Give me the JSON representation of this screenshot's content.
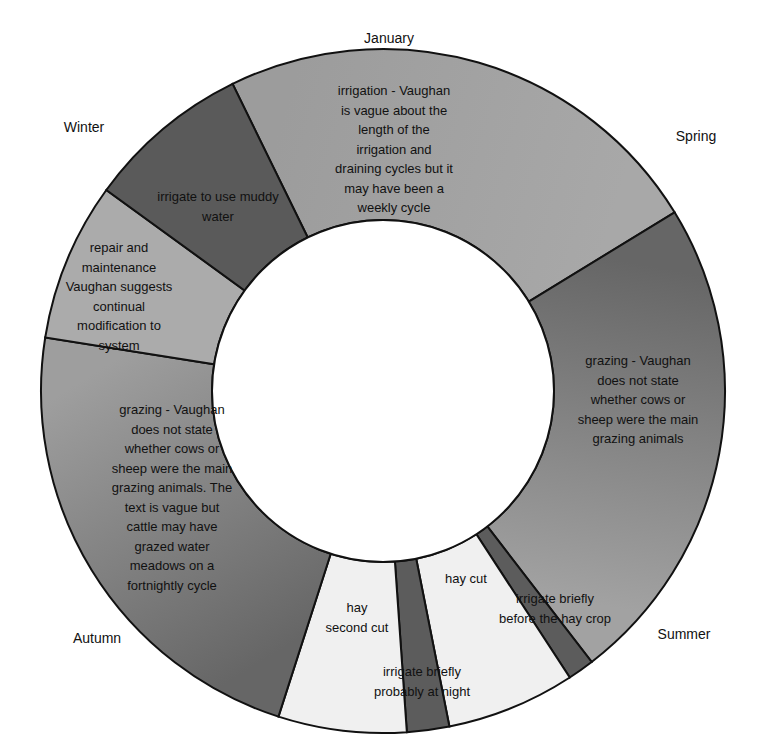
{
  "chart_data": {
    "type": "pie",
    "subtype": "donut",
    "title": "",
    "start_angle_deg": 333.9,
    "center": [
      383,
      391
    ],
    "outer_radius": 342,
    "inner_radius": 171,
    "segments": [
      {
        "label": "irrigation - Vaughan is vague about the length of the irrigation and draining cycles but it may have been a weekly cycle",
        "lines": [
          "irrigation - Vaughan",
          "is vague about the",
          "length of the",
          "irrigation and",
          "draining cycles but it",
          "may have been a",
          "weekly cycle"
        ],
        "value": 84.6,
        "color": "#9c9c9c",
        "color_end": "#a8a8a8",
        "label_pos": [
          394,
          95
        ]
      },
      {
        "label": "grazing - Vaughan does not state whether cows or sheep were the main grazing animals",
        "lines": [
          "grazing - Vaughan",
          "does not state",
          "whether cows or",
          "sheep were the main",
          "grazing animals"
        ],
        "value": 83.9,
        "color": "#666666",
        "color_end": "#a2a2a2",
        "label_pos": [
          638,
          365
        ]
      },
      {
        "label": "irrigate briefly before the hay crop",
        "lines": [
          "irrigate briefly",
          "before the hay crop"
        ],
        "value": 4.5,
        "color": "#5c5c5c",
        "color_end": "#5c5c5c",
        "label_pos": [
          555,
          603
        ]
      },
      {
        "label": "hay cut",
        "lines": [
          "hay cut"
        ],
        "value": 21.9,
        "color": "#f0f0f0",
        "color_end": "#f0f0f0",
        "label_pos": [
          466,
          583
        ]
      },
      {
        "label": "irrigate briefly probably at night",
        "lines": [
          "irrigate briefly",
          "probably at night"
        ],
        "value": 7.2,
        "color": "#5c5c5c",
        "color_end": "#5c5c5c",
        "label_pos": [
          422,
          676
        ]
      },
      {
        "label": "hay second cut",
        "lines": [
          "hay",
          "second cut"
        ],
        "value": 21.8,
        "color": "#f0f0f0",
        "color_end": "#f0f0f0",
        "label_pos": [
          357,
          612
        ]
      },
      {
        "label": "grazing - Vaughan does not state whether cows or sheep were the main grazing animals. The text is vague but cattle may have grazed water meadows on a fortnightly cycle",
        "lines": [
          "grazing - Vaughan",
          "does not state",
          "whether cows or",
          "sheep were the main",
          "grazing animals. The",
          "text is vague but",
          "cattle may have",
          "grazed water",
          "meadows on a",
          "fortnightly cycle"
        ],
        "value": 81.2,
        "color": "#666666",
        "color_end": "#9e9e9e",
        "label_pos": [
          172,
          414
        ]
      },
      {
        "label": "repair and maintenance Vaughan suggests continual modification to system",
        "lines": [
          "repair and",
          "maintenance",
          "Vaughan suggests",
          "continual",
          "modification to",
          "system"
        ],
        "value": 27.0,
        "color": "#ababab",
        "color_end": "#ababab",
        "label_pos": [
          119,
          252
        ]
      },
      {
        "label": "irrigate to use muddy water",
        "lines": [
          "irrigate to use muddy",
          "water"
        ],
        "value": 27.9,
        "color": "#5a5a5a",
        "color_end": "#5a5a5a",
        "label_pos": [
          218,
          201
        ]
      }
    ],
    "category_labels": [
      {
        "text": "January",
        "pos": [
          389,
          43
        ]
      },
      {
        "text": "Spring",
        "pos": [
          696,
          141
        ]
      },
      {
        "text": "Summer",
        "pos": [
          684,
          639
        ]
      },
      {
        "text": "Autumn",
        "pos": [
          97,
          643
        ]
      },
      {
        "text": "Winter",
        "pos": [
          84,
          132
        ]
      }
    ],
    "unit": "degrees of annual cycle",
    "legend": "none",
    "stroke_color": "#111111",
    "hole_color": "#ffffff"
  }
}
